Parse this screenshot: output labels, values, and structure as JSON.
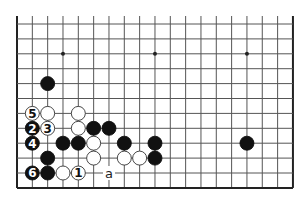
{
  "diagram": {
    "type": "go-board-fragment",
    "colors": {
      "background": "#ffffff",
      "grid_line": "#555555",
      "edge_line": "#222222",
      "black_stone": "#111111",
      "white_stone": "#ffffff",
      "white_stone_outline": "#333333"
    },
    "grid": {
      "columns": 19,
      "rows": 12,
      "origin_x": 17,
      "origin_y": 24,
      "spacing_x": 15.33,
      "spacing_y": 14.9,
      "top_overhang": 8,
      "edges": {
        "left": true,
        "right": true,
        "bottom": true,
        "top": false
      }
    },
    "star_points": [
      {
        "col": 3,
        "row": 2
      },
      {
        "col": 9,
        "row": 2
      },
      {
        "col": 15,
        "row": 2
      }
    ],
    "stones": [
      {
        "color": "black",
        "col": 2,
        "row": 4,
        "label": ""
      },
      {
        "color": "white",
        "col": 1,
        "row": 6,
        "label": "5"
      },
      {
        "color": "white",
        "col": 2,
        "row": 6,
        "label": ""
      },
      {
        "color": "white",
        "col": 4,
        "row": 6,
        "label": ""
      },
      {
        "color": "black",
        "col": 1,
        "row": 7,
        "label": "2"
      },
      {
        "color": "white",
        "col": 2,
        "row": 7,
        "label": "3"
      },
      {
        "color": "white",
        "col": 4,
        "row": 7,
        "label": ""
      },
      {
        "color": "black",
        "col": 5,
        "row": 7,
        "label": ""
      },
      {
        "color": "black",
        "col": 6,
        "row": 7,
        "label": ""
      },
      {
        "color": "black",
        "col": 1,
        "row": 8,
        "label": "4"
      },
      {
        "color": "black",
        "col": 3,
        "row": 8,
        "label": ""
      },
      {
        "color": "black",
        "col": 4,
        "row": 8,
        "label": ""
      },
      {
        "color": "white",
        "col": 5,
        "row": 8,
        "label": ""
      },
      {
        "color": "black",
        "col": 7,
        "row": 8,
        "label": ""
      },
      {
        "color": "black",
        "col": 9,
        "row": 8,
        "label": ""
      },
      {
        "color": "black",
        "col": 15,
        "row": 8,
        "label": ""
      },
      {
        "color": "black",
        "col": 2,
        "row": 9,
        "label": ""
      },
      {
        "color": "white",
        "col": 5,
        "row": 9,
        "label": ""
      },
      {
        "color": "white",
        "col": 7,
        "row": 9,
        "label": ""
      },
      {
        "color": "white",
        "col": 8,
        "row": 9,
        "label": ""
      },
      {
        "color": "black",
        "col": 9,
        "row": 9,
        "label": ""
      },
      {
        "color": "black",
        "col": 1,
        "row": 10,
        "label": "6"
      },
      {
        "color": "black",
        "col": 2,
        "row": 10,
        "label": ""
      },
      {
        "color": "white",
        "col": 3,
        "row": 10,
        "label": ""
      },
      {
        "color": "white",
        "col": 4,
        "row": 10,
        "label": "1"
      }
    ],
    "point_labels": [
      {
        "col": 6,
        "row": 10,
        "text": "a"
      }
    ]
  }
}
